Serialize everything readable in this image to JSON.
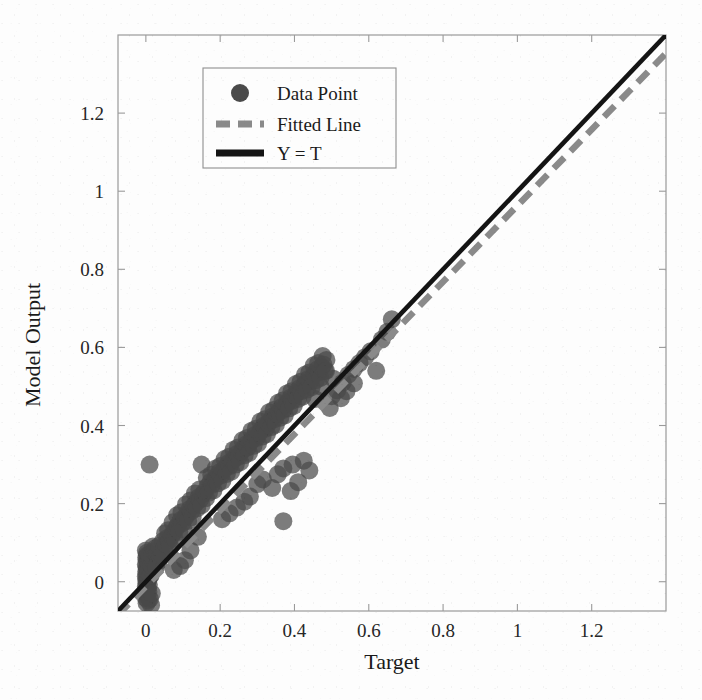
{
  "chart_data": {
    "type": "scatter",
    "title": "",
    "xlabel": "Target",
    "ylabel": "Model Output",
    "xlim": [
      -0.075,
      1.4
    ],
    "ylim": [
      -0.075,
      1.4
    ],
    "xticks": [
      "0",
      "0.2",
      "0.4",
      "0.6",
      "0.8",
      "1",
      "1.2"
    ],
    "yticks": [
      "0",
      "0.2",
      "0.4",
      "0.6",
      "0.8",
      "1",
      "1.2"
    ],
    "xtick_values": [
      0,
      0.2,
      0.4,
      0.6,
      0.8,
      1.0,
      1.2
    ],
    "ytick_values": [
      0,
      0.2,
      0.4,
      0.6,
      0.8,
      1.0,
      1.2
    ],
    "grid": false,
    "legend_position": "upper-left-inset",
    "colors": {
      "data_point": "#4a4a4a",
      "fitted_line": "#8a8a8a",
      "identity_line": "#141414",
      "axis": "#9a9a9a",
      "background": "#fdfdfd"
    },
    "marker": {
      "shape": "circle",
      "radius_px": 9,
      "opacity": 0.72
    },
    "series": [
      {
        "name": "Data Point",
        "type": "scatter",
        "points": [
          [
            0.0,
            -0.042
          ],
          [
            0.001,
            -0.03
          ],
          [
            0.002,
            -0.02
          ],
          [
            0.0,
            -0.012
          ],
          [
            0.003,
            -0.005
          ],
          [
            0.001,
            0.002
          ],
          [
            0.002,
            0.008
          ],
          [
            0.0,
            0.014
          ],
          [
            0.004,
            0.02
          ],
          [
            0.001,
            0.026
          ],
          [
            0.003,
            0.032
          ],
          [
            0.002,
            0.038
          ],
          [
            0.0,
            0.044
          ],
          [
            0.005,
            0.05
          ],
          [
            0.002,
            0.056
          ],
          [
            0.001,
            0.062
          ],
          [
            0.004,
            0.068
          ],
          [
            0.003,
            0.074
          ],
          [
            0.0,
            0.08
          ],
          [
            0.002,
            -0.055
          ],
          [
            0.006,
            -0.048
          ],
          [
            0.004,
            -0.036
          ],
          [
            0.007,
            -0.026
          ],
          [
            0.005,
            -0.016
          ],
          [
            0.008,
            -0.008
          ],
          [
            0.006,
            0.004
          ],
          [
            0.009,
            0.012
          ],
          [
            0.007,
            0.024
          ],
          [
            0.01,
            0.036
          ],
          [
            0.008,
            0.048
          ],
          [
            0.012,
            0.06
          ],
          [
            0.009,
            0.07
          ],
          [
            0.014,
            -0.06
          ],
          [
            0.011,
            -0.044
          ],
          [
            0.016,
            -0.03
          ],
          [
            0.013,
            0.016
          ],
          [
            0.018,
            0.028
          ],
          [
            0.015,
            0.042
          ],
          [
            0.02,
            0.054
          ],
          [
            0.017,
            0.066
          ],
          [
            0.022,
            0.078
          ],
          [
            0.019,
            0.09
          ],
          [
            0.01,
            0.3
          ],
          [
            0.026,
            0.086
          ],
          [
            0.03,
            0.07
          ],
          [
            0.034,
            0.052
          ],
          [
            0.028,
            0.038
          ],
          [
            0.038,
            0.062
          ],
          [
            0.042,
            0.078
          ],
          [
            0.036,
            0.092
          ],
          [
            0.046,
            0.104
          ],
          [
            0.05,
            0.088
          ],
          [
            0.044,
            0.068
          ],
          [
            0.054,
            0.096
          ],
          [
            0.058,
            0.112
          ],
          [
            0.052,
            0.124
          ],
          [
            0.062,
            0.106
          ],
          [
            0.066,
            0.09
          ],
          [
            0.07,
            0.118
          ],
          [
            0.06,
            0.132
          ],
          [
            0.074,
            0.126
          ],
          [
            0.078,
            0.11
          ],
          [
            0.082,
            0.138
          ],
          [
            0.072,
            0.152
          ],
          [
            0.086,
            0.144
          ],
          [
            0.09,
            0.128
          ],
          [
            0.094,
            0.158
          ],
          [
            0.084,
            0.17
          ],
          [
            0.098,
            0.15
          ],
          [
            0.102,
            0.134
          ],
          [
            0.106,
            0.164
          ],
          [
            0.096,
            0.178
          ],
          [
            0.11,
            0.172
          ],
          [
            0.114,
            0.156
          ],
          [
            0.118,
            0.186
          ],
          [
            0.108,
            0.198
          ],
          [
            0.122,
            0.18
          ],
          [
            0.126,
            0.166
          ],
          [
            0.13,
            0.196
          ],
          [
            0.12,
            0.208
          ],
          [
            0.134,
            0.202
          ],
          [
            0.138,
            0.188
          ],
          [
            0.142,
            0.216
          ],
          [
            0.132,
            0.226
          ],
          [
            0.146,
            0.21
          ],
          [
            0.15,
            0.196
          ],
          [
            0.154,
            0.224
          ],
          [
            0.144,
            0.236
          ],
          [
            0.158,
            0.23
          ],
          [
            0.162,
            0.214
          ],
          [
            0.15,
            0.3
          ],
          [
            0.166,
            0.244
          ],
          [
            0.17,
            0.228
          ],
          [
            0.174,
            0.256
          ],
          [
            0.164,
            0.266
          ],
          [
            0.178,
            0.248
          ],
          [
            0.182,
            0.234
          ],
          [
            0.186,
            0.262
          ],
          [
            0.176,
            0.274
          ],
          [
            0.19,
            0.268
          ],
          [
            0.194,
            0.252
          ],
          [
            0.198,
            0.28
          ],
          [
            0.188,
            0.29
          ],
          [
            0.202,
            0.272
          ],
          [
            0.206,
            0.258
          ],
          [
            0.21,
            0.286
          ],
          [
            0.2,
            0.296
          ],
          [
            0.214,
            0.292
          ],
          [
            0.218,
            0.276
          ],
          [
            0.222,
            0.304
          ],
          [
            0.212,
            0.314
          ],
          [
            0.226,
            0.296
          ],
          [
            0.23,
            0.282
          ],
          [
            0.234,
            0.31
          ],
          [
            0.224,
            0.32
          ],
          [
            0.238,
            0.316
          ],
          [
            0.242,
            0.3
          ],
          [
            0.246,
            0.328
          ],
          [
            0.236,
            0.338
          ],
          [
            0.25,
            0.32
          ],
          [
            0.254,
            0.306
          ],
          [
            0.258,
            0.334
          ],
          [
            0.248,
            0.344
          ],
          [
            0.262,
            0.34
          ],
          [
            0.266,
            0.324
          ],
          [
            0.27,
            0.352
          ],
          [
            0.26,
            0.362
          ],
          [
            0.274,
            0.344
          ],
          [
            0.278,
            0.33
          ],
          [
            0.282,
            0.358
          ],
          [
            0.272,
            0.368
          ],
          [
            0.286,
            0.364
          ],
          [
            0.29,
            0.348
          ],
          [
            0.294,
            0.376
          ],
          [
            0.284,
            0.386
          ],
          [
            0.298,
            0.368
          ],
          [
            0.302,
            0.354
          ],
          [
            0.306,
            0.382
          ],
          [
            0.296,
            0.392
          ],
          [
            0.31,
            0.388
          ],
          [
            0.314,
            0.372
          ],
          [
            0.318,
            0.4
          ],
          [
            0.308,
            0.41
          ],
          [
            0.322,
            0.392
          ],
          [
            0.326,
            0.378
          ],
          [
            0.33,
            0.406
          ],
          [
            0.32,
            0.416
          ],
          [
            0.334,
            0.412
          ],
          [
            0.338,
            0.396
          ],
          [
            0.342,
            0.424
          ],
          [
            0.332,
            0.434
          ],
          [
            0.346,
            0.416
          ],
          [
            0.35,
            0.402
          ],
          [
            0.354,
            0.43
          ],
          [
            0.344,
            0.44
          ],
          [
            0.358,
            0.436
          ],
          [
            0.362,
            0.42
          ],
          [
            0.366,
            0.448
          ],
          [
            0.356,
            0.458
          ],
          [
            0.37,
            0.44
          ],
          [
            0.374,
            0.426
          ],
          [
            0.378,
            0.454
          ],
          [
            0.368,
            0.464
          ],
          [
            0.382,
            0.46
          ],
          [
            0.386,
            0.444
          ],
          [
            0.37,
            0.155
          ],
          [
            0.39,
            0.472
          ],
          [
            0.38,
            0.482
          ],
          [
            0.394,
            0.464
          ],
          [
            0.398,
            0.45
          ],
          [
            0.402,
            0.478
          ],
          [
            0.392,
            0.488
          ],
          [
            0.406,
            0.484
          ],
          [
            0.41,
            0.468
          ],
          [
            0.414,
            0.496
          ],
          [
            0.404,
            0.506
          ],
          [
            0.418,
            0.488
          ],
          [
            0.422,
            0.474
          ],
          [
            0.426,
            0.502
          ],
          [
            0.416,
            0.512
          ],
          [
            0.43,
            0.508
          ],
          [
            0.434,
            0.492
          ],
          [
            0.438,
            0.52
          ],
          [
            0.428,
            0.53
          ],
          [
            0.442,
            0.512
          ],
          [
            0.446,
            0.498
          ],
          [
            0.45,
            0.526
          ],
          [
            0.44,
            0.536
          ],
          [
            0.454,
            0.532
          ],
          [
            0.458,
            0.516
          ],
          [
            0.462,
            0.544
          ],
          [
            0.452,
            0.554
          ],
          [
            0.466,
            0.536
          ],
          [
            0.47,
            0.522
          ],
          [
            0.474,
            0.55
          ],
          [
            0.464,
            0.56
          ],
          [
            0.478,
            0.556
          ],
          [
            0.482,
            0.54
          ],
          [
            0.486,
            0.568
          ],
          [
            0.476,
            0.578
          ],
          [
            0.12,
            0.08
          ],
          [
            0.105,
            0.055
          ],
          [
            0.14,
            0.115
          ],
          [
            0.092,
            0.04
          ],
          [
            0.075,
            0.03
          ],
          [
            0.3,
            0.25
          ],
          [
            0.315,
            0.262
          ],
          [
            0.34,
            0.24
          ],
          [
            0.355,
            0.275
          ],
          [
            0.37,
            0.29
          ],
          [
            0.395,
            0.3
          ],
          [
            0.41,
            0.255
          ],
          [
            0.425,
            0.31
          ],
          [
            0.44,
            0.285
          ],
          [
            0.39,
            0.232
          ],
          [
            0.265,
            0.205
          ],
          [
            0.28,
            0.218
          ],
          [
            0.245,
            0.19
          ],
          [
            0.225,
            0.175
          ],
          [
            0.205,
            0.16
          ],
          [
            0.5,
            0.475
          ],
          [
            0.515,
            0.49
          ],
          [
            0.53,
            0.51
          ],
          [
            0.545,
            0.53
          ],
          [
            0.56,
            0.545
          ],
          [
            0.575,
            0.56
          ],
          [
            0.59,
            0.575
          ],
          [
            0.605,
            0.59
          ],
          [
            0.62,
            0.54
          ],
          [
            0.635,
            0.62
          ],
          [
            0.65,
            0.64
          ],
          [
            0.662,
            0.672
          ],
          [
            0.56,
            0.508
          ],
          [
            0.525,
            0.47
          ],
          [
            0.495,
            0.445
          ],
          [
            0.485,
            0.54
          ],
          [
            0.47,
            0.5
          ],
          [
            0.455,
            0.468
          ],
          [
            0.505,
            0.52
          ],
          [
            0.54,
            0.488
          ]
        ]
      },
      {
        "name": "Fitted Line",
        "type": "line",
        "style": "dashed",
        "slope": 0.975,
        "intercept": -0.012,
        "x_range": [
          -0.075,
          1.4
        ]
      },
      {
        "name": "Y = T",
        "type": "line",
        "style": "solid",
        "slope": 1.0,
        "intercept": 0.0,
        "x_range": [
          -0.075,
          1.4
        ]
      }
    ]
  },
  "legend": {
    "entries": [
      {
        "label": "Data Point",
        "marker": "filled-circle"
      },
      {
        "label": "Fitted Line",
        "marker": "dashed-line"
      },
      {
        "label": "Y = T",
        "marker": "solid-line"
      }
    ]
  },
  "axes": {
    "x_title": "Target",
    "y_title": "Model Output"
  }
}
